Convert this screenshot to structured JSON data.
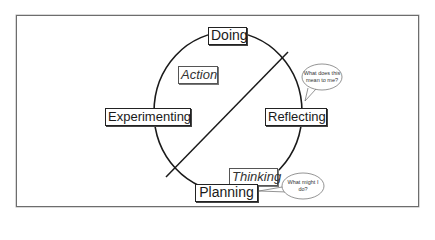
{
  "diagram": {
    "type": "cycle",
    "title": "",
    "nodes": {
      "top": "Doing",
      "right": "Reflecting",
      "bottom": "Planning",
      "left": "Experimenting"
    },
    "regions": {
      "upper_left": "Action",
      "lower_right": "Thinking"
    },
    "speech_bubbles": {
      "reflecting": [
        "What does this",
        "mean to me?"
      ],
      "planning": [
        "What might I",
        "do?"
      ]
    },
    "colors": {
      "stroke": "#1a1a1a",
      "frame": "#6d6d6d",
      "background": "#ffffff"
    }
  }
}
